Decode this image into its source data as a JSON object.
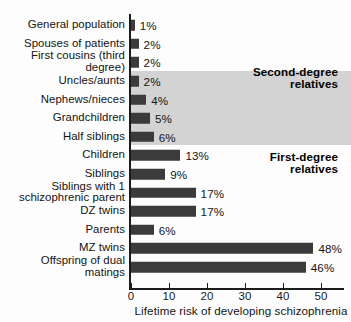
{
  "chart_data": {
    "type": "bar",
    "orientation": "horizontal",
    "title": "",
    "xlabel": "Lifetime risk of developing schizophrenia",
    "ylabel": "",
    "xlim": [
      0,
      55
    ],
    "xticks": [
      0,
      10,
      20,
      30,
      40,
      50
    ],
    "xtick_labels": [
      "0",
      "10",
      "20",
      "30",
      "40",
      "50"
    ],
    "grid": false,
    "legend": null,
    "bar_color": "#3b3b3b",
    "band_color": "#d3d3d3",
    "categories": [
      "General population",
      "Spouses of patients",
      "First cousins (third degree)",
      "Uncles/aunts",
      "Nephews/nieces",
      "Grandchildren",
      "Half siblings",
      "Children",
      "Siblings",
      "Siblings with 1\nschizophrenic parent",
      "DZ twins",
      "Parents",
      "MZ twins",
      "Offspring of dual matings"
    ],
    "values": [
      1,
      2,
      2,
      2,
      4,
      5,
      6,
      13,
      9,
      17,
      17,
      6,
      48,
      46
    ],
    "value_labels": [
      "1%",
      "2%",
      "2%",
      "2%",
      "4%",
      "5%",
      "6%",
      "13%",
      "9%",
      "17%",
      "17%",
      "6%",
      "48%",
      "46%"
    ],
    "annotations": [
      {
        "text": "Second-degree\nrelatives",
        "covers": [
          "Uncles/aunts",
          "Nephews/nieces",
          "Grandchildren",
          "Half siblings"
        ]
      },
      {
        "text": "First-degree\nrelatives",
        "covers": [
          "Children",
          "Siblings",
          "Siblings with 1 schizophrenic parent",
          "DZ twins",
          "Parents",
          "MZ twins",
          "Offspring of dual matings"
        ]
      }
    ]
  }
}
